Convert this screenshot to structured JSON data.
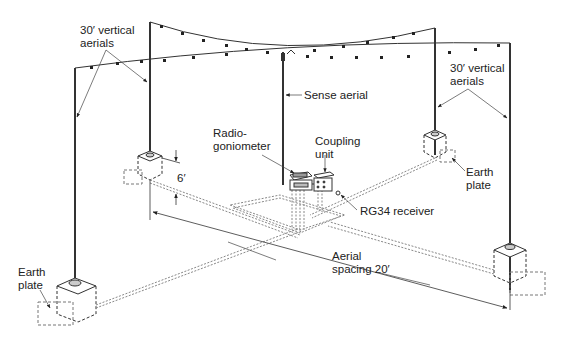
{
  "diagram": {
    "type": "Adcock direction-finding aerial array",
    "labels": {
      "vertical_aerials_left": "30′ vertical\naerials",
      "vertical_aerials_right": "30′ vertical\naerials",
      "sense_aerial": "Sense aerial",
      "radiogoniometer": "Radio-\ngoniometer",
      "coupling_unit": "Coupling\nunit",
      "earth_plate_right": "Earth\nplate",
      "earth_plate_left": "Earth\nplate",
      "height_dimension": "6′",
      "receiver": "RG34 receiver",
      "aerial_spacing": "Aerial\nspacing 20′"
    },
    "components": [
      {
        "name": "vertical-aerial",
        "count": 4,
        "height": "30′"
      },
      {
        "name": "sense-aerial",
        "count": 1
      },
      {
        "name": "radiogoniometer",
        "count": 1
      },
      {
        "name": "coupling-unit",
        "count": 1
      },
      {
        "name": "earth-plate",
        "count": 4
      },
      {
        "name": "rg34-receiver",
        "count": 1
      }
    ],
    "dimensions": {
      "aerial_height": "30′",
      "base_height": "6′",
      "aerial_spacing": "20′"
    },
    "colors": {
      "line": "#333333",
      "thin_line": "#555555",
      "dashed": "#777777",
      "background": "#ffffff"
    }
  }
}
